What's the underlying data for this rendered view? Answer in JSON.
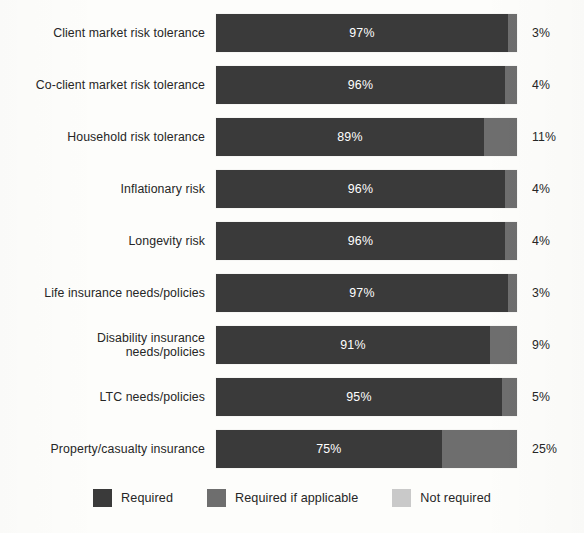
{
  "chart_data": {
    "type": "bar",
    "title": "",
    "subtitle": "",
    "xlabel": "",
    "ylabel": "",
    "orientation": "horizontal",
    "stacked": true,
    "normalized_percent": true,
    "xlim": [
      0,
      100
    ],
    "grid": false,
    "legend_position": "bottom",
    "categories": [
      "Client market risk tolerance",
      "Co-client market risk tolerance",
      "Household risk tolerance",
      "Inflationary risk",
      "Longevity risk",
      "Life insurance needs/policies",
      "Disability insurance needs/policies",
      "LTC needs/policies",
      "Property/casualty insurance"
    ],
    "series": [
      {
        "name": "Required",
        "color": "#3a3a3a",
        "values": [
          97,
          96,
          89,
          96,
          96,
          97,
          91,
          95,
          75
        ]
      },
      {
        "name": "Required if applicable",
        "color": "#6e6e6e",
        "values": [
          3,
          4,
          11,
          4,
          4,
          3,
          9,
          5,
          25
        ]
      },
      {
        "name": "Not required",
        "color": "#c9c9c9",
        "values": [
          0,
          0,
          0,
          0,
          0,
          0,
          0,
          0,
          0
        ]
      }
    ],
    "bar_value_labels": [
      "97%",
      "96%",
      "89%",
      "96%",
      "96%",
      "97%",
      "91%",
      "95%",
      "75%"
    ],
    "end_labels": [
      "3%",
      "4%",
      "11%",
      "4%",
      "4%",
      "3%",
      "9%",
      "5%",
      "25%"
    ]
  },
  "rows": [
    {
      "label_lines": [
        "Client market risk tolerance"
      ],
      "required": 97,
      "if_applicable": 3,
      "not_required": 0,
      "value_label": "97%",
      "end_label": "3%"
    },
    {
      "label_lines": [
        "Co-client market risk tolerance"
      ],
      "required": 96,
      "if_applicable": 4,
      "not_required": 0,
      "value_label": "96%",
      "end_label": "4%"
    },
    {
      "label_lines": [
        "Household risk tolerance"
      ],
      "required": 89,
      "if_applicable": 11,
      "not_required": 0,
      "value_label": "89%",
      "end_label": "11%"
    },
    {
      "label_lines": [
        "Inflationary risk"
      ],
      "required": 96,
      "if_applicable": 4,
      "not_required": 0,
      "value_label": "96%",
      "end_label": "4%"
    },
    {
      "label_lines": [
        "Longevity risk"
      ],
      "required": 96,
      "if_applicable": 4,
      "not_required": 0,
      "value_label": "96%",
      "end_label": "4%"
    },
    {
      "label_lines": [
        "Life insurance needs/policies"
      ],
      "required": 97,
      "if_applicable": 3,
      "not_required": 0,
      "value_label": "97%",
      "end_label": "3%"
    },
    {
      "label_lines": [
        "Disability insurance",
        "needs/policies"
      ],
      "required": 91,
      "if_applicable": 9,
      "not_required": 0,
      "value_label": "91%",
      "end_label": "9%"
    },
    {
      "label_lines": [
        "LTC needs/policies"
      ],
      "required": 95,
      "if_applicable": 5,
      "not_required": 0,
      "value_label": "95%",
      "end_label": "5%"
    },
    {
      "label_lines": [
        "Property/casualty insurance"
      ],
      "required": 75,
      "if_applicable": 25,
      "not_required": 0,
      "value_label": "75%",
      "end_label": "25%"
    }
  ],
  "legend": {
    "items": [
      {
        "label": "Required",
        "color": "#3a3a3a"
      },
      {
        "label": "Required if applicable",
        "color": "#6e6e6e"
      },
      {
        "label": "Not required",
        "color": "#c9c9c9"
      }
    ]
  }
}
